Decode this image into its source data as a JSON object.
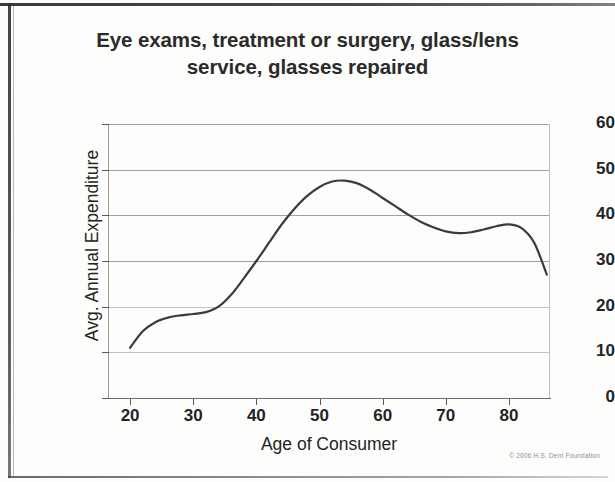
{
  "title": "Eye exams, treatment or surgery, glass/lens service, glasses repaired",
  "title_line1": "Eye exams, treatment or surgery, glass/lens",
  "title_line2": "service, glasses repaired",
  "credit": "© 2006 H.S. Dent Foundation",
  "colors": {
    "line": "#3b3b3b",
    "grid": "#8f8f8f",
    "text": "#242424",
    "background": "#fdfdfc"
  },
  "chart_data": {
    "type": "line",
    "title": "Eye exams, treatment or surgery, glass/lens service, glasses repaired",
    "xlabel": "Age of Consumer",
    "ylabel": "Avg. Annual Expenditure",
    "xlim": [
      16.5,
      86.5
    ],
    "ylim": [
      0,
      60
    ],
    "xticks": [
      20,
      30,
      40,
      50,
      60,
      70,
      80
    ],
    "xtick_labels": [
      "20",
      "30",
      "40",
      "50",
      "60",
      "70",
      "80"
    ],
    "yticks": [
      0,
      10,
      20,
      30,
      40,
      50,
      60
    ],
    "ytick_labels": [
      "0",
      "10",
      "20",
      "30",
      "40",
      "50",
      "60"
    ],
    "grid": true,
    "grid_axis": "y",
    "legend": false,
    "series": [
      {
        "name": "Avg. Annual Expenditure",
        "x": [
          20,
          22,
          24,
          26,
          28,
          30,
          32,
          34,
          36,
          38,
          40,
          42,
          44,
          46,
          48,
          50,
          52,
          54,
          56,
          58,
          60,
          62,
          64,
          66,
          68,
          70,
          72,
          74,
          76,
          78,
          80,
          82,
          84,
          86
        ],
        "values": [
          11.0,
          14.6,
          16.6,
          17.6,
          18.1,
          18.4,
          18.8,
          20.0,
          22.6,
          26.2,
          30.0,
          34.0,
          38.0,
          41.4,
          44.2,
          46.2,
          47.4,
          47.6,
          47.0,
          45.6,
          43.8,
          42.0,
          40.2,
          38.6,
          37.4,
          36.5,
          36.1,
          36.3,
          36.9,
          37.6,
          38.0,
          37.2,
          34.0,
          27.0
        ]
      }
    ],
    "annotations": [
      {
        "label": "peak",
        "x": 54,
        "y": 47.6
      },
      {
        "label": "early plateau",
        "x": 30,
        "y": 18.4
      },
      {
        "label": "local minimum",
        "x": 72,
        "y": 36.1
      },
      {
        "label": "secondary bump",
        "x": 80,
        "y": 38.0
      },
      {
        "label": "endpoint",
        "x": 86,
        "y": 27.0
      }
    ]
  }
}
